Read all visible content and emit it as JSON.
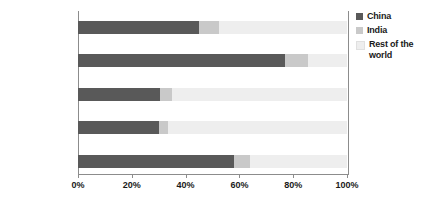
{
  "chart_data": {
    "type": "bar",
    "orientation": "horizontal",
    "stacked": true,
    "title": "",
    "xlabel": "",
    "ylabel": "",
    "xlim": [
      0,
      100
    ],
    "xticks": [
      "0%",
      "20%",
      "40%",
      "60%",
      "80%",
      "100%"
    ],
    "xtick_values": [
      0,
      20,
      40,
      60,
      80,
      100
    ],
    "grid": false,
    "legend_position": "right",
    "categories": [
      "Energy demand",
      "Coal demand",
      "Oil demand",
      "Oil imports",
      "CO2 emissions"
    ],
    "series": [
      {
        "name": "China",
        "color": "#595959",
        "values": [
          45,
          77,
          30.5,
          30,
          58
        ]
      },
      {
        "name": "India",
        "color": "#c9c9c9",
        "values": [
          7.5,
          8.5,
          4.5,
          3.5,
          6
        ]
      },
      {
        "name": "Rest of the world",
        "color": "#eeeeee",
        "values": [
          47.5,
          14.5,
          65,
          66.5,
          36
        ]
      }
    ]
  },
  "categories": [
    {
      "label": "Energy demand",
      "label_prefix": "Energy demand",
      "subscript": "",
      "label_suffix": ""
    },
    {
      "label": "Coal demand",
      "label_prefix": "Coal demand",
      "subscript": "",
      "label_suffix": ""
    },
    {
      "label": "Oil demand",
      "label_prefix": "Oil demand",
      "subscript": "",
      "label_suffix": ""
    },
    {
      "label": "Oil imports",
      "label_prefix": "Oil imports",
      "subscript": "",
      "label_suffix": ""
    },
    {
      "label": "CO2 emissions",
      "label_prefix": "CO",
      "subscript": "2",
      "label_suffix": " emissions"
    }
  ],
  "legend": {
    "items": [
      {
        "label": "China",
        "color": "#595959"
      },
      {
        "label": "India",
        "color": "#c9c9c9"
      },
      {
        "label": "Rest of the world",
        "color": "#eeeeee"
      }
    ]
  },
  "axis": {
    "ticks": [
      {
        "label": "0%",
        "value": 0
      },
      {
        "label": "20%",
        "value": 20
      },
      {
        "label": "40%",
        "value": 40
      },
      {
        "label": "60%",
        "value": 60
      },
      {
        "label": "80%",
        "value": 80
      },
      {
        "label": "100%",
        "value": 100
      }
    ]
  },
  "colors": {
    "china": "#595959",
    "india": "#c9c9c9",
    "rest_of_world": "#eeeeee",
    "axis": "#8c8c8c",
    "text": "#1a1a1a",
    "background": "#ffffff"
  }
}
